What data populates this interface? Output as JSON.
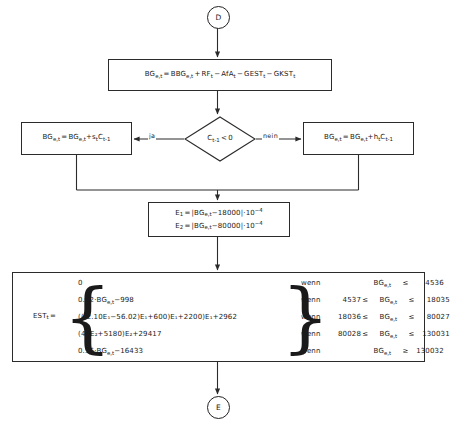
{
  "diagram": {
    "type": "flowchart",
    "language": "de",
    "connectors": {
      "top": "D",
      "bottom": "E"
    },
    "edge_labels": {
      "yes": "ja",
      "no": "nein"
    },
    "nodes": {
      "bg_main": {
        "lhs": "BG",
        "lhs_sub": "e,t",
        "eq": "=",
        "terms": [
          {
            "op": "",
            "name": "BBG",
            "sub": "e,t"
          },
          {
            "op": "+",
            "name": "RF",
            "sub": "t"
          },
          {
            "op": "−",
            "name": "AfA",
            "sub": "t"
          },
          {
            "op": "−",
            "name": "GEST",
            "sub": "t"
          },
          {
            "op": "−",
            "name": "GKST",
            "sub": "t"
          }
        ]
      },
      "decision": {
        "var": "C",
        "var_sub": "t-1",
        "comparator": "<",
        "value": "0"
      },
      "bg_yes": {
        "lhs": "BG",
        "lhs_sub": "e,t",
        "eq": "=",
        "rhs1": "BG",
        "rhs1_sub": "e,t",
        "plus": "+",
        "coef": "s",
        "coef_sub": "t",
        "factor": "C",
        "factor_sub": "t-1"
      },
      "bg_no": {
        "lhs": "BG",
        "lhs_sub": "e,t",
        "eq": "=",
        "rhs1": "BG",
        "rhs1_sub": "e,t",
        "plus": "+",
        "coef": "h",
        "coef_sub": "t",
        "factor": "C",
        "factor_sub": "t-1"
      },
      "e_definitions": [
        {
          "name": "E",
          "name_sub": "1",
          "eq": "=",
          "abs_open": "|",
          "var": "BG",
          "var_sub": "e,t",
          "offset": "−18000",
          "abs_close": "|",
          "mult": "·",
          "base": "10",
          "exp": "−4"
        },
        {
          "name": "E",
          "name_sub": "2",
          "eq": "=",
          "abs_open": "|",
          "var": "BG",
          "var_sub": "e,t",
          "offset": "−80000",
          "abs_close": "|",
          "mult": "·",
          "base": "10",
          "exp": "−4"
        }
      ],
      "est": {
        "head": "EST",
        "head_sub": "t",
        "eq": "=",
        "cases": [
          {
            "text": "0"
          },
          {
            "text": "0.22·BG",
            "sub": "e,t",
            "tail": "−998"
          },
          {
            "text": "(((2.10E₁−56.02)E₁+600)E₁+2200)E₁+2962"
          },
          {
            "text": "(42E₂+5180)E₂+29417"
          },
          {
            "text": "0.56·BG",
            "sub": "e,t",
            "tail": "−16433"
          }
        ],
        "conditions": [
          {
            "wenn": "wenn",
            "lo": "",
            "mid_var": "BG",
            "mid_sub": "e,t",
            "cmp_hi": "≤",
            "hi": "4536",
            "cmp_lo": ""
          },
          {
            "wenn": "wenn",
            "lo": "4537",
            "mid_var": "BG",
            "mid_sub": "e,t",
            "cmp_hi": "≤",
            "hi": "18035",
            "cmp_lo": "≤"
          },
          {
            "wenn": "wenn",
            "lo": "18036",
            "mid_var": "BG",
            "mid_sub": "e,t",
            "cmp_hi": "≤",
            "hi": "80027",
            "cmp_lo": "≤"
          },
          {
            "wenn": "wenn",
            "lo": "80028",
            "mid_var": "BG",
            "mid_sub": "e,t",
            "cmp_hi": "≤",
            "hi": "130031",
            "cmp_lo": "≤"
          },
          {
            "wenn": "wenn",
            "lo": "",
            "mid_var": "BG",
            "mid_sub": "e,t",
            "cmp_hi": "≥",
            "hi": "130032",
            "cmp_lo": ""
          }
        ]
      }
    },
    "colors": {
      "stroke": "#2b2b2b",
      "background": "#ffffff",
      "text": "#1a1a1a"
    }
  }
}
